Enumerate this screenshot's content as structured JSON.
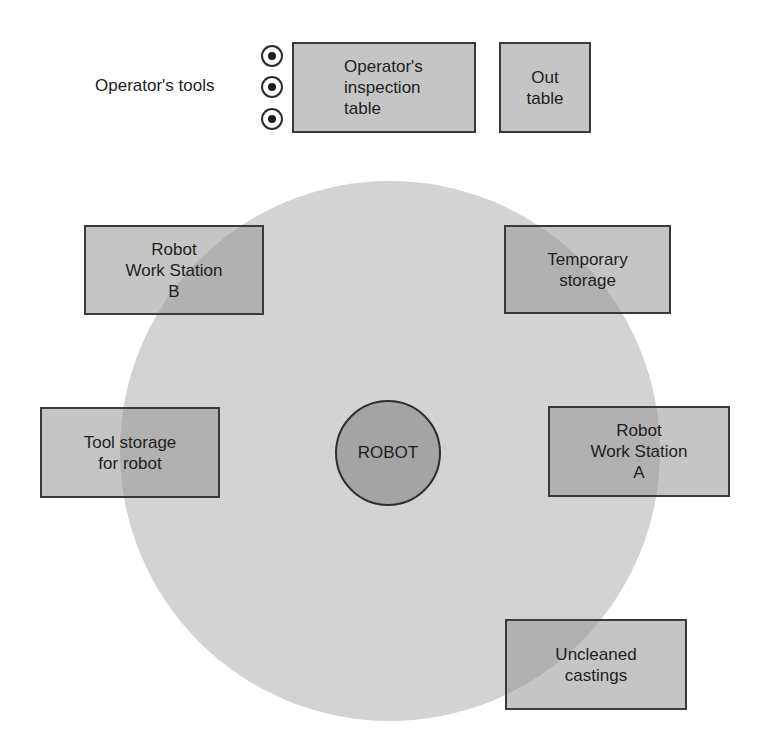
{
  "diagram": {
    "type": "robot work cell layout",
    "colors": {
      "reach_circle": "#d3d3d3",
      "box_fill": "#969696",
      "box_border": "#3a3a3a",
      "robot_fill": "#a4a4a4"
    },
    "operator_tools": {
      "label": "Operator's tools",
      "count": 3
    },
    "robot": {
      "label": "ROBOT"
    },
    "stations": [
      {
        "id": "inspection-table",
        "label": "Operator's\ninspection\ntable"
      },
      {
        "id": "out-table",
        "label": "Out\ntable"
      },
      {
        "id": "work-station-b",
        "label": "Robot\nWork Station\nB"
      },
      {
        "id": "temporary-storage",
        "label": "Temporary\nstorage"
      },
      {
        "id": "tool-storage",
        "label": "Tool storage\nfor robot"
      },
      {
        "id": "work-station-a",
        "label": "Robot\nWork Station\nA"
      },
      {
        "id": "uncleaned-castings",
        "label": "Uncleaned\ncastings"
      }
    ]
  }
}
